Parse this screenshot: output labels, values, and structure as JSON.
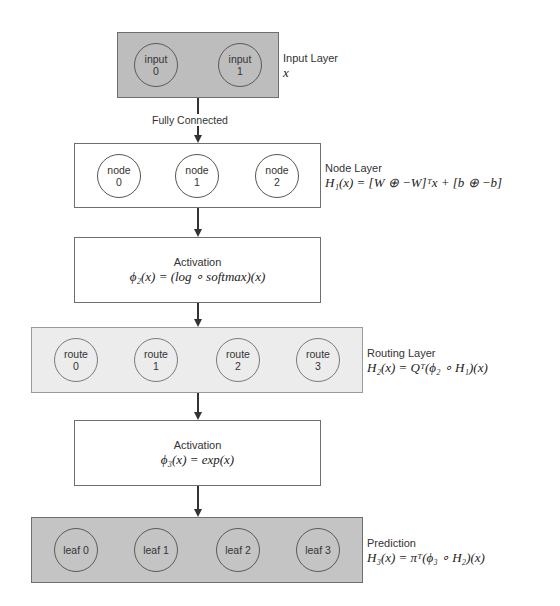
{
  "diagram": {
    "input_layer": {
      "label": "Input Layer",
      "formula": "x",
      "nodes": [
        {
          "name": "input",
          "index": "0"
        },
        {
          "name": "input",
          "index": "1"
        }
      ]
    },
    "edge_fully_connected": "Fully Connected",
    "node_layer": {
      "label": "Node Layer",
      "formula": "H₁(x) = [W ⊕ −W]ᵀx + [b ⊕ −b]",
      "nodes": [
        {
          "name": "node",
          "index": "0"
        },
        {
          "name": "node",
          "index": "1"
        },
        {
          "name": "node",
          "index": "2"
        }
      ]
    },
    "activation_1": {
      "title": "Activation",
      "formula": "ϕ₂(x) = (log ∘ softmax)(x)"
    },
    "routing_layer": {
      "label": "Routing Layer",
      "formula": "H₂(x) = Qᵀ(ϕ₂ ∘ H₁)(x)",
      "nodes": [
        {
          "name": "route",
          "index": "0"
        },
        {
          "name": "route",
          "index": "1"
        },
        {
          "name": "route",
          "index": "2"
        },
        {
          "name": "route",
          "index": "3"
        }
      ]
    },
    "activation_2": {
      "title": "Activation",
      "formula": "ϕ₃(x) = exp(x)"
    },
    "prediction_layer": {
      "label": "Prediction",
      "formula": "H₃(x) = πᵀ(ϕ₃ ∘ H₂)(x)",
      "nodes": [
        {
          "label": "leaf 0"
        },
        {
          "label": "leaf 1"
        },
        {
          "label": "leaf 2"
        },
        {
          "label": "leaf 3"
        }
      ]
    },
    "colors": {
      "input_fill": "#bdbdbd",
      "routing_fill": "#ececec",
      "prediction_fill": "#c4c4c4",
      "stroke": "#333333"
    }
  }
}
